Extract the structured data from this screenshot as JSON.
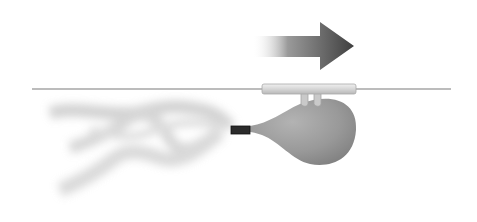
{
  "figure": {
    "components": [
      "motion-arrow",
      "string",
      "straw",
      "balloon",
      "nozzle",
      "exhaust-air"
    ],
    "colors": {
      "background": "#ffffff",
      "arrow": "#4a4a4a",
      "string": "#7a7a7a",
      "straw": "#d8d8d8",
      "balloon": "#9a9a9a",
      "nozzle": "#2b2b2b",
      "exhaust": "#c8c8c8"
    },
    "direction": "right"
  }
}
